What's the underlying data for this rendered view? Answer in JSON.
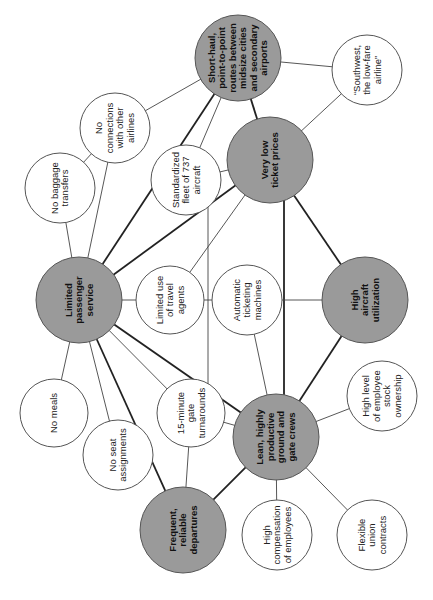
{
  "diagram": {
    "rotation_deg": -90,
    "colors": {
      "core_fill": "#9a9a9a",
      "supporting_fill": "#ffffff",
      "stroke": "#555555"
    },
    "nodes": [
      {
        "id": "short_haul",
        "type": "core",
        "cx": 238,
        "cy": 58,
        "r": 43,
        "lines": [
          "Short-haul,",
          "point-to-point",
          "routes between",
          "midsize cities",
          "and secondary",
          "airports"
        ]
      },
      {
        "id": "southwest",
        "type": "supporting",
        "cx": 367,
        "cy": 70,
        "r": 35,
        "lines": [
          "“Southwest,",
          "the low-fare",
          "airline”"
        ]
      },
      {
        "id": "very_low_prices",
        "type": "core",
        "cx": 270,
        "cy": 160,
        "r": 43,
        "lines": [
          "Very low",
          "ticket prices"
        ]
      },
      {
        "id": "no_connections",
        "type": "supporting",
        "cx": 115,
        "cy": 128,
        "r": 35,
        "lines": [
          "No",
          "connections",
          "with other",
          "airlines"
        ]
      },
      {
        "id": "no_baggage",
        "type": "supporting",
        "cx": 60,
        "cy": 188,
        "r": 35,
        "lines": [
          "No baggage",
          "transfers"
        ]
      },
      {
        "id": "standardized_fleet",
        "type": "supporting",
        "cx": 186,
        "cy": 180,
        "r": 35,
        "lines": [
          "Standardized",
          "fleet of 737",
          "aircraft"
        ]
      },
      {
        "id": "limited_service",
        "type": "core",
        "cx": 79,
        "cy": 300,
        "r": 43,
        "lines": [
          "Limited",
          "passenger",
          "service"
        ]
      },
      {
        "id": "travel_agents",
        "type": "supporting",
        "cx": 170,
        "cy": 300,
        "r": 34,
        "lines": [
          "Limited use",
          "of travel",
          "agents"
        ]
      },
      {
        "id": "ticketing_machines",
        "type": "supporting",
        "cx": 247,
        "cy": 300,
        "r": 35,
        "lines": [
          "Automatic",
          "ticketing",
          "machines"
        ]
      },
      {
        "id": "high_utilization",
        "type": "core",
        "cx": 365,
        "cy": 300,
        "r": 43,
        "lines": [
          "High",
          "aircraft",
          "utilization"
        ]
      },
      {
        "id": "no_meals",
        "type": "supporting",
        "cx": 54,
        "cy": 413,
        "r": 34,
        "lines": [
          "No meals"
        ]
      },
      {
        "id": "no_seat",
        "type": "supporting",
        "cx": 118,
        "cy": 455,
        "r": 35,
        "lines": [
          "No seat",
          "assignments"
        ]
      },
      {
        "id": "gate_turnarounds",
        "type": "supporting",
        "cx": 191,
        "cy": 413,
        "r": 34,
        "lines": [
          "15-minute",
          "gate",
          "turnarounds"
        ]
      },
      {
        "id": "stock_ownership",
        "type": "supporting",
        "cx": 382,
        "cy": 396,
        "r": 35,
        "lines": [
          "High level",
          "of employee",
          "stock",
          "ownership"
        ]
      },
      {
        "id": "lean_crews",
        "type": "core",
        "cx": 276,
        "cy": 437,
        "r": 43,
        "lines": [
          "Lean, highly",
          "productive",
          "ground and",
          "gate crews"
        ]
      },
      {
        "id": "frequent_departures",
        "type": "core",
        "cx": 183,
        "cy": 530,
        "r": 43,
        "lines": [
          "Frequent,",
          "reliable",
          "departures"
        ]
      },
      {
        "id": "high_compensation",
        "type": "supporting",
        "cx": 277,
        "cy": 535,
        "r": 35,
        "lines": [
          "High",
          "compensation",
          "of employees"
        ]
      },
      {
        "id": "union_contracts",
        "type": "supporting",
        "cx": 372,
        "cy": 535,
        "r": 35,
        "lines": [
          "Flexible",
          "union",
          "contracts"
        ]
      }
    ],
    "edges": [
      {
        "from": "short_haul",
        "to": "southwest",
        "weight": "thin"
      },
      {
        "from": "short_haul",
        "to": "very_low_prices",
        "weight": "thick"
      },
      {
        "from": "short_haul",
        "to": "no_connections",
        "weight": "thin"
      },
      {
        "from": "short_haul",
        "to": "standardized_fleet",
        "weight": "thin"
      },
      {
        "from": "short_haul",
        "to": "limited_service",
        "weight": "thick"
      },
      {
        "from": "southwest",
        "to": "very_low_prices",
        "weight": "thin"
      },
      {
        "from": "no_connections",
        "to": "no_baggage",
        "weight": "thin"
      },
      {
        "from": "no_connections",
        "to": "limited_service",
        "weight": "thin"
      },
      {
        "from": "no_baggage",
        "to": "limited_service",
        "weight": "thin"
      },
      {
        "from": "standardized_fleet",
        "to": "very_low_prices",
        "weight": "thin"
      },
      {
        "from": "standardized_fleet",
        "to": "gate_turnarounds",
        "weight": "thin",
        "path": "vertical",
        "x": 208
      },
      {
        "from": "very_low_prices",
        "to": "limited_service",
        "weight": "thick"
      },
      {
        "from": "very_low_prices",
        "to": "travel_agents",
        "weight": "thin"
      },
      {
        "from": "very_low_prices",
        "to": "high_utilization",
        "weight": "thick"
      },
      {
        "from": "very_low_prices",
        "to": "lean_crews",
        "weight": "thick",
        "path": "vertical",
        "x": 284
      },
      {
        "from": "limited_service",
        "to": "travel_agents",
        "weight": "thin"
      },
      {
        "from": "travel_agents",
        "to": "ticketing_machines",
        "weight": "thin"
      },
      {
        "from": "ticketing_machines",
        "to": "high_utilization",
        "weight": "thin"
      },
      {
        "from": "ticketing_machines",
        "to": "lean_crews",
        "weight": "thin"
      },
      {
        "from": "high_utilization",
        "to": "lean_crews",
        "weight": "thick"
      },
      {
        "from": "limited_service",
        "to": "no_meals",
        "weight": "thin"
      },
      {
        "from": "limited_service",
        "to": "no_seat",
        "weight": "thin"
      },
      {
        "from": "limited_service",
        "to": "gate_turnarounds",
        "weight": "thin"
      },
      {
        "from": "limited_service",
        "to": "frequent_departures",
        "weight": "thick"
      },
      {
        "from": "limited_service",
        "to": "lean_crews",
        "weight": "thick"
      },
      {
        "from": "gate_turnarounds",
        "to": "lean_crews",
        "weight": "thin"
      },
      {
        "from": "gate_turnarounds",
        "to": "frequent_departures",
        "weight": "thin"
      },
      {
        "from": "lean_crews",
        "to": "stock_ownership",
        "weight": "thin"
      },
      {
        "from": "lean_crews",
        "to": "frequent_departures",
        "weight": "thick"
      },
      {
        "from": "lean_crews",
        "to": "high_compensation",
        "weight": "thin"
      },
      {
        "from": "lean_crews",
        "to": "union_contracts",
        "weight": "thin"
      }
    ]
  }
}
